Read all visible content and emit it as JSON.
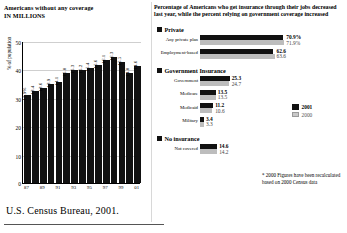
{
  "left": {
    "title_line1": "Americans without any coverage",
    "title_line2": "IN MILLIONS",
    "ylabel": "% of population",
    "source": "U.S. Census Bureau, 2001."
  },
  "right": {
    "title_line1": "Percentage of Americans who get insurance through their jobs decreased",
    "title_line2": "last year, while the percent relying on government coverage increased",
    "groups": [
      {
        "name": "Private"
      },
      {
        "name": "Government Insurance"
      },
      {
        "name": "No insurance"
      }
    ],
    "legend": {
      "a": "2001",
      "b": "2000"
    },
    "footnote": "* 2000 Figures have been recalculated based on 2000 Census data"
  },
  "chart_data": [
    {
      "type": "bar",
      "title": "Americans without any coverage IN MILLIONS",
      "xlabel": "",
      "ylabel": "% of population",
      "ylim": [
        0,
        50
      ],
      "yticks": [
        0,
        10,
        20,
        30,
        40,
        50
      ],
      "grid": true,
      "categories": [
        "87",
        "88",
        "89",
        "90",
        "91",
        "92",
        "93",
        "94",
        "95",
        "96",
        "97",
        "98",
        "99",
        "00",
        "01"
      ],
      "tick_labels": [
        "87",
        "",
        "89",
        "",
        "91",
        "",
        "93",
        "",
        "95",
        "",
        "97",
        "",
        "99",
        "",
        "01"
      ],
      "values": [
        31.0,
        32.5,
        33.4,
        34.7,
        35.4,
        38.6,
        39.7,
        39.7,
        40.6,
        41.7,
        43.4,
        44.3,
        42.6,
        38.7,
        41.2
      ],
      "value_labels": [
        "12.9%",
        "13.4",
        "13.6",
        "13.9",
        "14.1",
        "15.0",
        "15.3",
        "15.2",
        "15.4",
        "15.6",
        "16.1",
        "16.3",
        "15.5",
        "14.0",
        "14.6"
      ],
      "series_color": "#111111"
    },
    {
      "type": "bar",
      "orientation": "horizontal",
      "title": "Percentage of Americans who get insurance through their jobs decreased last year, while the percent relying on government coverage increased",
      "xlabel": "Percent of population",
      "ylabel": "",
      "xlim": [
        0,
        75
      ],
      "legend_position": "right",
      "groups": [
        {
          "group": "Private",
          "rows": [
            {
              "label": "Any private plan",
              "y2001": 70.9,
              "y2000": 71.9,
              "label_2001": "70.9%",
              "label_2000": "71.9%"
            },
            {
              "label": "Employment-based",
              "y2001": 62.6,
              "y2000": 63.6,
              "label_2001": "62.6",
              "label_2000": "63.6"
            }
          ]
        },
        {
          "group": "Government Insurance",
          "rows": [
            {
              "label": "Government",
              "y2001": 25.3,
              "y2000": 24.7,
              "label_2001": "25.3",
              "label_2000": "24.7"
            },
            {
              "label": "Medicare",
              "y2001": 13.5,
              "y2000": 13.5,
              "label_2001": "13.5",
              "label_2000": "13.5"
            },
            {
              "label": "Medicaid",
              "y2001": 11.2,
              "y2000": 10.6,
              "label_2001": "11.2",
              "label_2000": "10.6"
            },
            {
              "label": "Military",
              "y2001": 3.4,
              "y2000": 3.3,
              "label_2001": "3.4",
              "label_2000": "3.3"
            }
          ]
        },
        {
          "group": "No insurance",
          "rows": [
            {
              "label": "Not covered",
              "y2001": 14.6,
              "y2000": 14.2,
              "label_2001": "14.6",
              "label_2000": "14.2"
            }
          ]
        }
      ],
      "series": [
        {
          "name": "2001",
          "color": "#111111"
        },
        {
          "name": "2000",
          "color": "#bdbdbd"
        }
      ]
    }
  ]
}
